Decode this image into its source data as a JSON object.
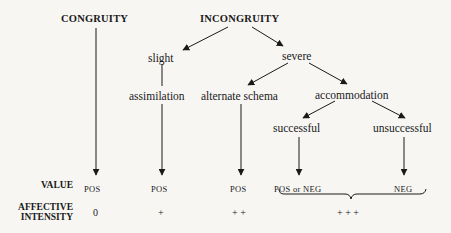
{
  "diagram": {
    "nodes": {
      "congruity": "CONGRUITY",
      "incongruity": "INCONGRUITY",
      "slight": "slight",
      "severe": "severe",
      "assimilation": "assimilation",
      "alternate_schema": "alternate schema",
      "accommodation": "accommodation",
      "successful": "successful",
      "unsuccessful": "unsuccessful"
    },
    "row_labels": {
      "value": "VALUE",
      "affective_line1": "AFFECTIVE",
      "affective_line2": "INTENSITY"
    },
    "values": [
      "POS",
      "POS",
      "POS",
      "POS or NEG",
      "NEG"
    ],
    "intensities": [
      "0",
      "+",
      "+ +",
      "+ + +"
    ],
    "edges": [
      [
        "INCONGRUITY",
        "slight"
      ],
      [
        "INCONGRUITY",
        "severe"
      ],
      [
        "slight",
        "assimilation"
      ],
      [
        "severe",
        "alternate schema"
      ],
      [
        "severe",
        "accommodation"
      ],
      [
        "accommodation",
        "successful"
      ],
      [
        "accommodation",
        "unsuccessful"
      ],
      [
        "CONGRUITY",
        "POS"
      ],
      [
        "assimilation",
        "POS"
      ],
      [
        "alternate schema",
        "POS"
      ],
      [
        "successful",
        "POS or NEG"
      ],
      [
        "unsuccessful",
        "NEG"
      ]
    ],
    "brace": "groups 'POS or NEG' and 'NEG' under intensity '+ + +'"
  }
}
